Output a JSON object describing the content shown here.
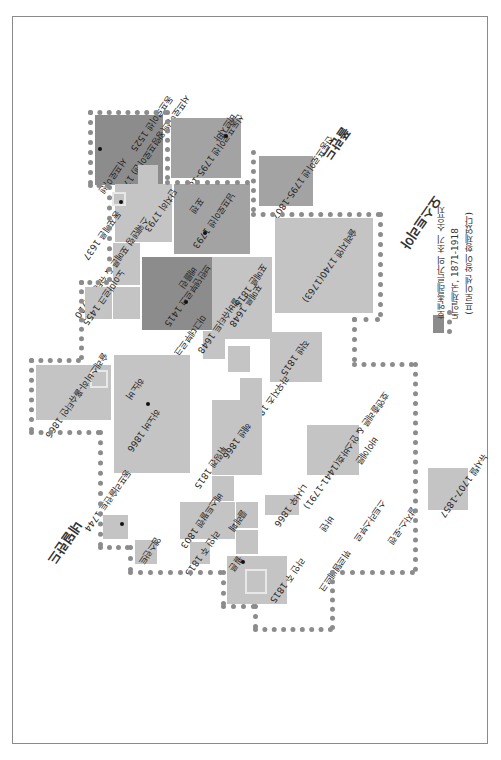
{
  "map": {
    "orientation": "rotated 180 degrees",
    "legend": {
      "items": [
        {
          "label": "호엔촐레른가의 초기 소유지",
          "swatch": "#8c8c8c",
          "type": "fill"
        },
        {
          "label": "독일제국, 1871-1918",
          "swatch": "#8c8c8c",
          "type": "dotted-line"
        },
        {
          "label": "(프로이센 왕이 황제였다)",
          "type": "note"
        }
      ]
    },
    "regions": {
      "poland": "폴란드",
      "austria": "오스트리아",
      "netherlands": "네덜란드"
    },
    "territories": {
      "t1": "동프로이센 1525",
      "t1b": "서프로이센(왕령프로이센) 1772",
      "t2": "프로이센",
      "t3": "신동프로이센 1795-1807",
      "t3b": "신동프로이센 1795-1807",
      "t4": "남프로이센 1793",
      "t4c": "포젠",
      "t5": "슐레지엔 1740(1763)",
      "t6": "단치히 1793",
      "t7": "포메른 1648",
      "t8": "포메른 1815",
      "t9": "동포메른 1637",
      "t10": "스웨덴령 포메른 & 슈테틴 1720",
      "t11": "노이마르크 1455",
      "t12": "브란덴부르크 1415",
      "t12c": "베를린",
      "t13": "마그데부르크 1648",
      "t14": "할버슈타트 1648",
      "t15": "작센 1815",
      "t16": "라우지츠 1815",
      "t17": "하노버 1866",
      "t17c": "하노버",
      "t18": "슐레스비히-홀슈타인 1866",
      "t19": "헤센 1866",
      "t20": "튀링겐 1815",
      "t21": "바이에른",
      "t22": "뷔르템베르크",
      "t23": "호엔촐레른 & 안스바흐(1441-1791)",
      "t24": "바덴",
      "t25": "나사우 1866",
      "t26": "베스트팔렌 1803",
      "t27": "클레페",
      "t28": "라인 주 1815",
      "t28c": "쾰른",
      "t29": "뉴샤텔 1707-1857",
      "t30": "안스바흐 1791",
      "t31": "바이로이트 1791",
      "t32": "동프리슬란트 1744",
      "t33": "메클렌부르크",
      "t34": "올덴부르크",
      "t35": "엠스란트",
      "t36": "알자스-로렌",
      "t37": "스트라스부르",
      "t38": "서프로이센",
      "t39": "바르샤바"
    }
  }
}
